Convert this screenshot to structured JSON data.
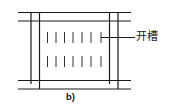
{
  "diagram": {
    "type": "plan-view schematic",
    "caption": "b)",
    "annotation": {
      "label": "开槽",
      "leader_from": [
        101,
        37.5
      ],
      "leader_to": [
        135,
        37.5
      ]
    },
    "line_color": "#1a1a1a",
    "horizontal_lines": [
      {
        "y": 12.5,
        "x1": 18,
        "x2": 131
      },
      {
        "y": 21,
        "x1": 18,
        "x2": 131
      },
      {
        "y": 80.5,
        "x1": 18,
        "x2": 131
      },
      {
        "y": 89,
        "x1": 18,
        "x2": 131
      }
    ],
    "vertical_lines": [
      {
        "x": 31,
        "y1": 12,
        "y2": 84
      },
      {
        "x": 39.5,
        "y1": 12,
        "y2": 89
      },
      {
        "x": 109.5,
        "y1": 12,
        "y2": 84
      },
      {
        "x": 118,
        "y1": 12,
        "y2": 89
      }
    ],
    "slots": {
      "count_per_row": 7,
      "x_positions": [
        47.5,
        56,
        64.5,
        73,
        82,
        91,
        101
      ],
      "rows": [
        {
          "y1": 32,
          "y2": 43
        },
        {
          "y1": 56,
          "y2": 67
        }
      ]
    }
  }
}
